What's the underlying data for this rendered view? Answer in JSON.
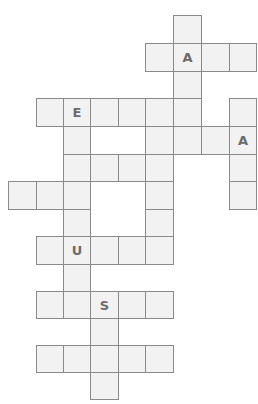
{
  "puzzle": {
    "type": "crossword",
    "colors": {
      "cell_fill": "#f2f2f2",
      "cell_border": "#8a8a8a",
      "letter": "#6b6b6b",
      "background": "#ffffff"
    },
    "col_edges": [
      8,
      36,
      63,
      90,
      118,
      145,
      173,
      201,
      229,
      256
    ],
    "row_edges": [
      15,
      43,
      71,
      98,
      126,
      154,
      181,
      209,
      236,
      264,
      291,
      318,
      345,
      372,
      399
    ],
    "cells": [
      {
        "r": 0,
        "c": 6,
        "letter": ""
      },
      {
        "r": 1,
        "c": 5,
        "letter": ""
      },
      {
        "r": 1,
        "c": 6,
        "letter": "A"
      },
      {
        "r": 1,
        "c": 7,
        "letter": ""
      },
      {
        "r": 1,
        "c": 8,
        "letter": ""
      },
      {
        "r": 2,
        "c": 6,
        "letter": ""
      },
      {
        "r": 3,
        "c": 1,
        "letter": ""
      },
      {
        "r": 3,
        "c": 2,
        "letter": "E"
      },
      {
        "r": 3,
        "c": 3,
        "letter": ""
      },
      {
        "r": 3,
        "c": 4,
        "letter": ""
      },
      {
        "r": 3,
        "c": 5,
        "letter": ""
      },
      {
        "r": 3,
        "c": 6,
        "letter": ""
      },
      {
        "r": 3,
        "c": 8,
        "letter": ""
      },
      {
        "r": 4,
        "c": 2,
        "letter": ""
      },
      {
        "r": 4,
        "c": 5,
        "letter": ""
      },
      {
        "r": 4,
        "c": 6,
        "letter": ""
      },
      {
        "r": 4,
        "c": 7,
        "letter": ""
      },
      {
        "r": 4,
        "c": 8,
        "letter": "A"
      },
      {
        "r": 5,
        "c": 2,
        "letter": ""
      },
      {
        "r": 5,
        "c": 3,
        "letter": ""
      },
      {
        "r": 5,
        "c": 4,
        "letter": ""
      },
      {
        "r": 5,
        "c": 5,
        "letter": ""
      },
      {
        "r": 5,
        "c": 8,
        "letter": ""
      },
      {
        "r": 6,
        "c": 0,
        "letter": ""
      },
      {
        "r": 6,
        "c": 1,
        "letter": ""
      },
      {
        "r": 6,
        "c": 2,
        "letter": ""
      },
      {
        "r": 6,
        "c": 5,
        "letter": ""
      },
      {
        "r": 6,
        "c": 8,
        "letter": ""
      },
      {
        "r": 7,
        "c": 2,
        "letter": ""
      },
      {
        "r": 7,
        "c": 5,
        "letter": ""
      },
      {
        "r": 8,
        "c": 1,
        "letter": ""
      },
      {
        "r": 8,
        "c": 2,
        "letter": "U"
      },
      {
        "r": 8,
        "c": 3,
        "letter": ""
      },
      {
        "r": 8,
        "c": 4,
        "letter": ""
      },
      {
        "r": 8,
        "c": 5,
        "letter": ""
      },
      {
        "r": 9,
        "c": 2,
        "letter": ""
      },
      {
        "r": 10,
        "c": 1,
        "letter": ""
      },
      {
        "r": 10,
        "c": 2,
        "letter": ""
      },
      {
        "r": 10,
        "c": 3,
        "letter": "S"
      },
      {
        "r": 10,
        "c": 4,
        "letter": ""
      },
      {
        "r": 10,
        "c": 5,
        "letter": ""
      },
      {
        "r": 11,
        "c": 3,
        "letter": ""
      },
      {
        "r": 12,
        "c": 1,
        "letter": ""
      },
      {
        "r": 12,
        "c": 2,
        "letter": ""
      },
      {
        "r": 12,
        "c": 3,
        "letter": ""
      },
      {
        "r": 12,
        "c": 4,
        "letter": ""
      },
      {
        "r": 12,
        "c": 5,
        "letter": ""
      },
      {
        "r": 13,
        "c": 3,
        "letter": ""
      }
    ]
  }
}
